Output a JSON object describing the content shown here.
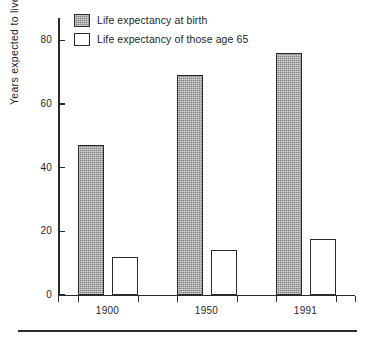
{
  "chart_data": {
    "type": "bar",
    "title": "",
    "subtitle": "",
    "xlabel": "",
    "ylabel": "Years expected to live",
    "categories": [
      "1900",
      "1950",
      "1991"
    ],
    "series": [
      {
        "name": "Life expectancy at birth",
        "values": [
          47,
          69,
          76
        ],
        "swatch": "series-0",
        "color": "#a9a9a9"
      },
      {
        "name": "Life expectancy of those age 65",
        "values": [
          12,
          14,
          17.5
        ],
        "swatch": "series-1",
        "color": "#ffffff"
      }
    ],
    "ylim": [
      0,
      87
    ],
    "y_ticks": [
      0,
      20,
      40,
      60,
      80
    ],
    "y_tick_labels": [
      "0",
      "20",
      "40",
      "60",
      "80"
    ],
    "grid": false,
    "legend_position": "top-left",
    "axis_color": "#2b2b2b",
    "background": "#ffffff"
  },
  "legend": {
    "entries": [
      {
        "label": "Life expectancy at birth",
        "swatch": "series-0"
      },
      {
        "label": "Life expectancy of those age 65",
        "swatch": "series-1"
      }
    ]
  },
  "axes": {
    "y_title": "Years expected to live",
    "y_tick_labels": [
      "80",
      "60",
      "40",
      "20",
      "0"
    ],
    "x_tick_labels": [
      "1900",
      "1950",
      "1991"
    ]
  }
}
